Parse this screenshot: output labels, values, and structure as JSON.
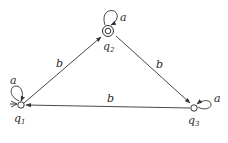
{
  "diagram": {
    "type": "finite-automaton",
    "states": [
      {
        "id": "q1",
        "name": "q",
        "sub": "1",
        "start": true,
        "accepting": false
      },
      {
        "id": "q2",
        "name": "q",
        "sub": "2",
        "start": false,
        "accepting": true
      },
      {
        "id": "q3",
        "name": "q",
        "sub": "3",
        "start": false,
        "accepting": false
      }
    ],
    "transitions": [
      {
        "from": "q1",
        "to": "q1",
        "label": "a"
      },
      {
        "from": "q1",
        "to": "q2",
        "label": "b"
      },
      {
        "from": "q2",
        "to": "q2",
        "label": "a"
      },
      {
        "from": "q2",
        "to": "q3",
        "label": "b"
      },
      {
        "from": "q3",
        "to": "q3",
        "label": "a"
      },
      {
        "from": "q3",
        "to": "q1",
        "label": "b"
      }
    ]
  },
  "labels": {
    "loop_q1": "a",
    "loop_q2": "a",
    "loop_q3": "a",
    "edge_q1_q2": "b",
    "edge_q2_q3": "b",
    "edge_q3_q1": "b",
    "q1_name": "q",
    "q1_sub": "1",
    "q2_name": "q",
    "q2_sub": "2",
    "q3_name": "q",
    "q3_sub": "3"
  }
}
